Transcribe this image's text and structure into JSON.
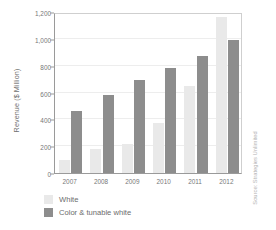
{
  "chart_data": {
    "type": "bar",
    "title": "",
    "xlabel": "",
    "ylabel": "Revenue ($ Million)",
    "categories": [
      "2007",
      "2008",
      "2009",
      "2010",
      "2011",
      "2012"
    ],
    "series": [
      {
        "name": "White",
        "color": "#e9e9e9",
        "values": [
          100,
          180,
          215,
          370,
          650,
          1160
        ]
      },
      {
        "name": "Color & tunable white",
        "color": "#8d8d8d",
        "values": [
          460,
          580,
          690,
          785,
          875,
          990
        ]
      }
    ],
    "ylim": [
      0,
      1200
    ],
    "yticks": [
      0,
      200,
      400,
      600,
      800,
      1000,
      1200
    ],
    "ytick_labels": [
      "0",
      "200",
      "400",
      "600",
      "800",
      "1,000",
      "1,200"
    ],
    "grid": true,
    "legend_position": "below-left"
  },
  "source": {
    "credit": "Source: Strategies Unlimited"
  }
}
